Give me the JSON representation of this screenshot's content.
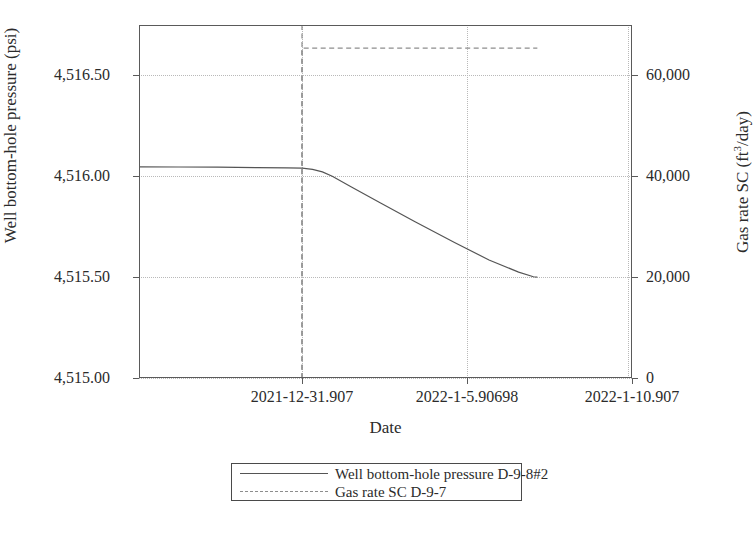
{
  "chart_data": {
    "type": "line",
    "title": "",
    "xlabel": "Date",
    "ylabel": "Well bottom-hole pressure (psi)",
    "y2label_parts": {
      "pre": "Gas rate SC (ft",
      "sup": "3",
      "post": "/day)"
    },
    "y2label": "Gas rate SC (ft3/day)",
    "grid": true,
    "legend_position": "below-center",
    "x_tick_labels": [
      "2021-12-31.907",
      "2022-1-5.90698",
      "2022-1-10.907"
    ],
    "x_tick_fracs": [
      0.3306,
      0.6653,
      1.0
    ],
    "ylim": [
      4515.0,
      4516.75
    ],
    "y_tick_labels": [
      "4,515.00",
      "4,515.50",
      "4,516.00",
      "4,516.50"
    ],
    "y_tick_values": [
      4515.0,
      4515.5,
      4516.0,
      4516.5
    ],
    "y2lim": [
      0,
      70000
    ],
    "y2_tick_labels": [
      "0",
      "20,000",
      "40,000",
      "60,000"
    ],
    "y2_tick_values": [
      0,
      20000,
      40000,
      60000
    ],
    "series": [
      {
        "name": "Well bottom-hole pressure D-9-8#2",
        "axis": "left",
        "style": "solid",
        "color": "#555555",
        "points": [
          {
            "x": 0.0,
            "y": 4516.047
          },
          {
            "x": 0.08,
            "y": 4516.046
          },
          {
            "x": 0.16,
            "y": 4516.045
          },
          {
            "x": 0.24,
            "y": 4516.043
          },
          {
            "x": 0.3,
            "y": 4516.042
          },
          {
            "x": 0.331,
            "y": 4516.04
          },
          {
            "x": 0.352,
            "y": 4516.034
          },
          {
            "x": 0.372,
            "y": 4516.022
          },
          {
            "x": 0.392,
            "y": 4516.0
          },
          {
            "x": 0.43,
            "y": 4515.948
          },
          {
            "x": 0.49,
            "y": 4515.868
          },
          {
            "x": 0.56,
            "y": 4515.775
          },
          {
            "x": 0.64,
            "y": 4515.672
          },
          {
            "x": 0.71,
            "y": 4515.585
          },
          {
            "x": 0.77,
            "y": 4515.525
          },
          {
            "x": 0.8,
            "y": 4515.502
          },
          {
            "x": 0.808,
            "y": 4515.5
          }
        ]
      },
      {
        "name": "Gas rate SC D-9-7",
        "axis": "right",
        "style": "dashed",
        "color": "#8d8d8d",
        "points": [
          {
            "x": 0.3306,
            "y": 0
          },
          {
            "x": 0.3306,
            "y": 65400
          },
          {
            "x": 0.808,
            "y": 65400
          }
        ]
      }
    ],
    "vertical_marker": {
      "x": 0.3306,
      "style": "dashed",
      "color": "#8d8d8d"
    }
  },
  "legend": {
    "entries": [
      {
        "label": "Well bottom-hole pressure D-9-8#2",
        "style": "solid"
      },
      {
        "label": "Gas rate SC D-9-7",
        "style": "dashed"
      }
    ]
  }
}
